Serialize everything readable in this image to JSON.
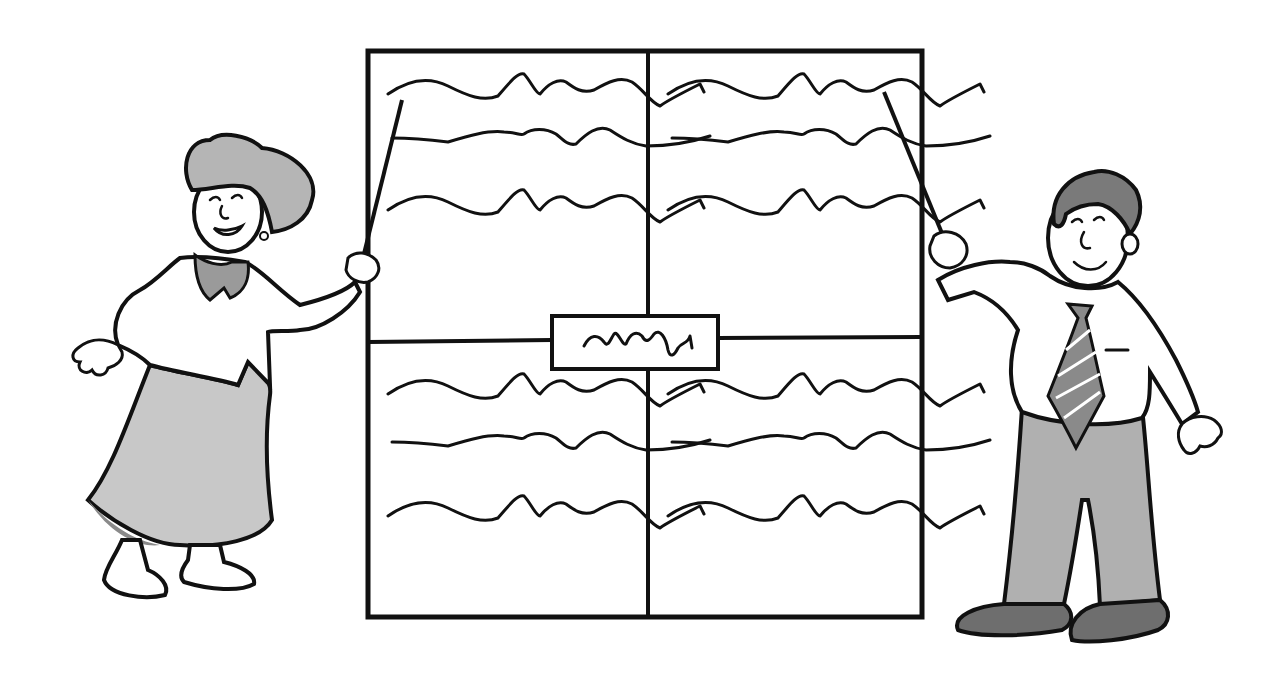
{
  "illustration": {
    "kind": "black-and-white clip art",
    "caption_visible": false,
    "colors": {
      "background": "#ffffff",
      "ink": "#111111",
      "light_gray": "#c8c8c8",
      "mid_gray": "#9a9a9a",
      "dark_gray": "#6e6e6e"
    }
  },
  "board": {
    "quadrants": [
      {
        "id": "top-left",
        "placeholder_lines": 3
      },
      {
        "id": "top-right",
        "placeholder_lines": 3
      },
      {
        "id": "bottom-left",
        "placeholder_lines": 3
      },
      {
        "id": "bottom-right",
        "placeholder_lines": 3
      }
    ],
    "center_label": {
      "placeholder_lines": 1
    }
  },
  "presenters": [
    {
      "id": "woman",
      "side": "left",
      "holding": "pointer",
      "outfit": "gray skirt, white blouse with gray collar"
    },
    {
      "id": "man",
      "side": "right",
      "holding": "pointer",
      "outfit": "white shirt, striped tie, gray trousers"
    }
  ]
}
